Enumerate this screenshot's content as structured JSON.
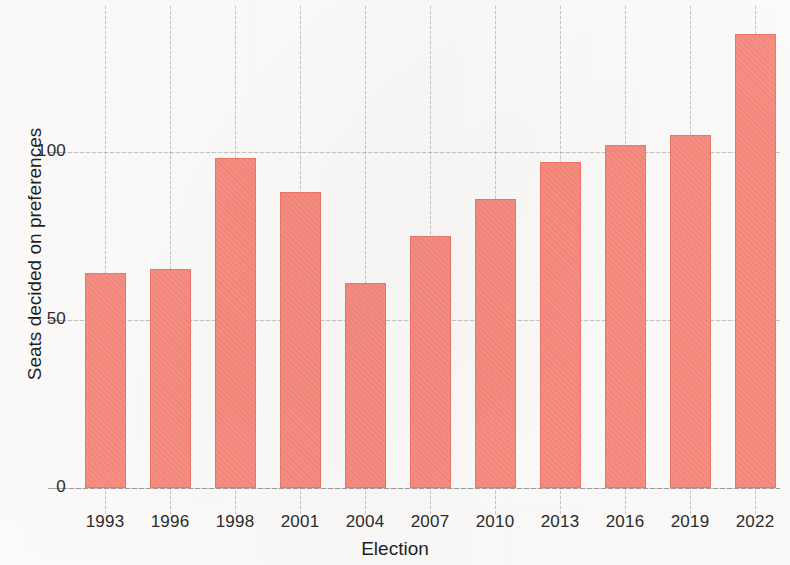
{
  "chart_data": {
    "type": "bar",
    "title": "",
    "xlabel": "Election",
    "ylabel": "Seats decided on preferences",
    "categories": [
      "1993",
      "1996",
      "1998",
      "2001",
      "2004",
      "2007",
      "2010",
      "2013",
      "2016",
      "2019",
      "2022"
    ],
    "values": [
      64,
      65,
      98,
      88,
      61,
      75,
      86,
      97,
      102,
      105,
      135
    ],
    "series": [
      {
        "name": "Seats decided on preferences",
        "values": [
          64,
          65,
          98,
          88,
          61,
          75,
          86,
          97,
          102,
          105,
          135
        ]
      }
    ],
    "ylim": [
      0,
      145
    ],
    "yticks": [
      0,
      50,
      100
    ],
    "yticklabels": [
      "0",
      "50",
      "100"
    ],
    "xticklabels": [
      "1993",
      "1996",
      "1998",
      "2001",
      "2004",
      "2007",
      "2010",
      "2013",
      "2016",
      "2019",
      "2022"
    ],
    "grid": "both-dashed",
    "legend": "none",
    "bar_color": "#f98a7e",
    "bar_edge_color": "#f0776a",
    "background_color": "#fdfcfb",
    "grid_color": "#78787c",
    "annotations": []
  }
}
